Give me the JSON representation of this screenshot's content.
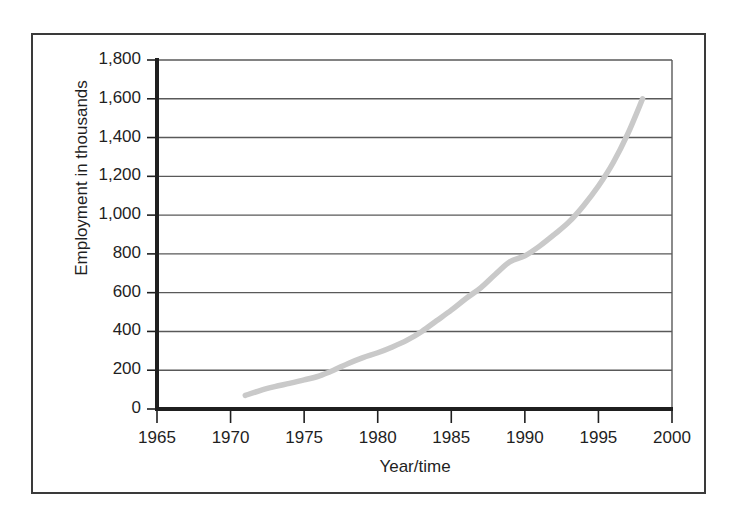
{
  "chart_data": {
    "type": "line",
    "title": "",
    "xlabel": "Year/time",
    "ylabel": "Employment in thousands",
    "xlim": [
      1965,
      2000
    ],
    "ylim": [
      0,
      1800
    ],
    "grid": true,
    "legend": "none",
    "line_color": "#c9c9c9",
    "axis_color": "#1f1f1f",
    "gridline_color": "#595959",
    "x_ticks": [
      "1965",
      "1970",
      "1975",
      "1980",
      "1985",
      "1990",
      "1995",
      "2000"
    ],
    "x_tick_values": [
      1965,
      1970,
      1975,
      1980,
      1985,
      1990,
      1995,
      2000
    ],
    "y_ticks": [
      "0",
      "200",
      "400",
      "600",
      "800",
      "1,000",
      "1,200",
      "1,400",
      "1,600",
      "1,800"
    ],
    "y_tick_values": [
      0,
      200,
      400,
      600,
      800,
      1000,
      1200,
      1400,
      1600,
      1800
    ],
    "series": [
      {
        "name": "Employment",
        "x": [
          1971,
          1972,
          1973,
          1974,
          1975,
          1976,
          1977,
          1978,
          1979,
          1980,
          1981,
          1982,
          1983,
          1984,
          1985,
          1986,
          1987,
          1988,
          1989,
          1990,
          1991,
          1992,
          1993,
          1994,
          1995,
          1996,
          1997,
          1998
        ],
        "values": [
          70,
          95,
          115,
          132,
          150,
          170,
          200,
          235,
          265,
          290,
          320,
          355,
          400,
          455,
          510,
          570,
          625,
          695,
          760,
          790,
          840,
          900,
          965,
          1050,
          1150,
          1270,
          1420,
          1600
        ]
      }
    ]
  }
}
